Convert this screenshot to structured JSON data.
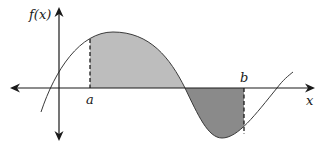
{
  "diagram": {
    "type": "function-area-diagram",
    "labels": {
      "y_axis": "f(x)",
      "x_axis": "x",
      "lower_bound": "a",
      "upper_bound": "b"
    },
    "colors": {
      "background": "#ffffff",
      "axis": "#1a1a1a",
      "curve": "#3a3a3a",
      "positive_area": "#bdbdbd",
      "negative_area": "#8a8a8a",
      "dashed_bound": "#1a1a1a"
    },
    "regions": [
      {
        "name": "positive-area",
        "from": "a",
        "to": "zero-crossing",
        "sign": "above axis",
        "shade": "light"
      },
      {
        "name": "negative-area",
        "from": "zero-crossing",
        "to": "b",
        "sign": "below axis",
        "shade": "dark"
      }
    ]
  }
}
